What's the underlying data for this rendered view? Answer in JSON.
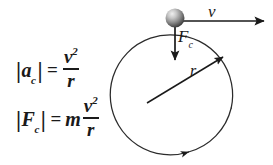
{
  "figure": {
    "background_color": "#ffffff",
    "ink_color": "#1a1a1a"
  },
  "equations": {
    "acceleration": {
      "name": "centripetal-acceleration",
      "left_bar": "|",
      "symbol": "a",
      "subscript": "c",
      "right_bar": "|",
      "equals": "=",
      "numerator": "v",
      "exponent": "2",
      "denominator": "r",
      "full_text": "|a_c| = v^2 / r"
    },
    "force": {
      "name": "centripetal-force",
      "left_bar": "|",
      "symbol": "F",
      "subscript": "c",
      "right_bar": "|",
      "equals": "=",
      "mass": "m",
      "numerator": "v",
      "exponent": "2",
      "denominator": "r",
      "full_text": "|F_c| = m v^2 / r"
    }
  },
  "diagram": {
    "circle": {
      "name": "orbit-path",
      "center_x": 173,
      "center_y": 95,
      "radius": 60,
      "stroke": "#2b2b2b",
      "stroke_width": 1.2
    },
    "ball": {
      "name": "orbiting-mass",
      "center_x": 175,
      "center_y": 18,
      "radius": 9.5,
      "highlight_color": "#e8e8e8",
      "mid_color": "#8f8f8f",
      "shadow_color": "#3d3d3d"
    },
    "velocity_vector": {
      "name": "velocity-arrow",
      "label": "v",
      "from_x": 184,
      "from_y": 21,
      "to_x": 266,
      "to_y": 21,
      "direction": "right-tangent"
    },
    "force_vector": {
      "name": "centripetal-force-arrow",
      "label": "F",
      "subscript": "c",
      "from_x": 175,
      "from_y": 27,
      "to_x": 175,
      "to_y": 63,
      "direction": "down-toward-center"
    },
    "radius_vector": {
      "name": "radius-arrow",
      "label": "r",
      "from_x": 147,
      "from_y": 103,
      "to_x": 224,
      "to_y": 56,
      "direction": "outward-upper-right"
    },
    "rotation_indicator": {
      "name": "rotation-direction-arrowhead",
      "at_x": 186,
      "at_y": 152,
      "direction": "counterclockwise"
    }
  }
}
